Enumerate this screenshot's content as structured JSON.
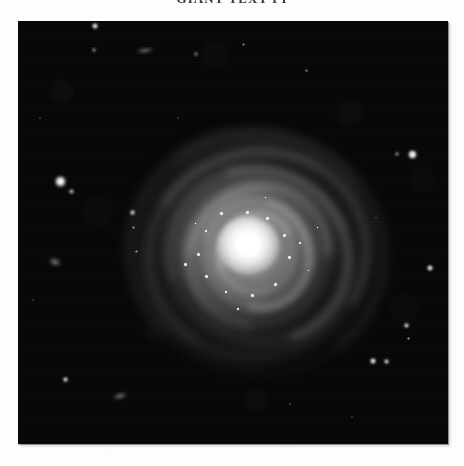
{
  "page": {
    "background_color": "#fdfdfd",
    "width": 464,
    "height": 466
  },
  "caption": {
    "text": "GIANT TEXT PI",
    "clipped": "true",
    "color": "#3a3a3a"
  },
  "plate": {
    "label": "astronomical-image-plate",
    "x": 18,
    "y": 21,
    "width": 430,
    "height": 423,
    "sky_color": "#060606",
    "border_color": "#050505"
  },
  "galaxy": {
    "name": "face-on-spiral-galaxy",
    "center_x": 248,
    "center_y": 245,
    "core_color": "#ffffff",
    "halo_color": "#d7d7d7",
    "arm_count": 4,
    "arms": [
      {
        "w": 210,
        "h": 196,
        "rot": -14,
        "thick": 9,
        "alpha": 0.2,
        "blur": 5,
        "dash_rot": 0
      },
      {
        "w": 172,
        "h": 160,
        "rot": 26,
        "thick": 10,
        "alpha": 0.24,
        "blur": 4.5,
        "dash_rot": 0
      },
      {
        "w": 134,
        "h": 124,
        "rot": -42,
        "thick": 10,
        "alpha": 0.28,
        "blur": 4,
        "dash_rot": 0
      },
      {
        "w": 100,
        "h": 93,
        "rot": 58,
        "thick": 9,
        "alpha": 0.3,
        "blur": 3.4,
        "dash_rot": 0
      },
      {
        "w": 246,
        "h": 230,
        "rot": 8,
        "thick": 8,
        "alpha": 0.13,
        "blur": 6,
        "dash_rot": 0
      },
      {
        "w": 72,
        "h": 66,
        "rot": -70,
        "thick": 8,
        "alpha": 0.3,
        "blur": 3,
        "dash_rot": 0
      }
    ],
    "knots": [
      {
        "x": 248,
        "y": 213,
        "d": 4.0
      },
      {
        "x": 268,
        "y": 219,
        "d": 3.4
      },
      {
        "x": 285,
        "y": 236,
        "d": 3.2
      },
      {
        "x": 290,
        "y": 258,
        "d": 3.8
      },
      {
        "x": 276,
        "y": 285,
        "d": 3.2
      },
      {
        "x": 253,
        "y": 296,
        "d": 3.4
      },
      {
        "x": 226,
        "y": 292,
        "d": 3.0
      },
      {
        "x": 207,
        "y": 277,
        "d": 4.0
      },
      {
        "x": 199,
        "y": 255,
        "d": 3.2
      },
      {
        "x": 206,
        "y": 231,
        "d": 3.0
      },
      {
        "x": 222,
        "y": 214,
        "d": 3.2
      },
      {
        "x": 300,
        "y": 243,
        "d": 3.0
      },
      {
        "x": 186,
        "y": 265,
        "d": 4.2
      },
      {
        "x": 238,
        "y": 309,
        "d": 3.0
      },
      {
        "x": 309,
        "y": 271,
        "d": 2.8
      },
      {
        "x": 266,
        "y": 198,
        "d": 2.6
      },
      {
        "x": 196,
        "y": 224,
        "d": 2.6
      },
      {
        "x": 318,
        "y": 228,
        "d": 2.4
      }
    ]
  },
  "field_stars": [
    {
      "name": "star-bright-west",
      "x": 60,
      "y": 181,
      "d": 11,
      "mag": 1.0
    },
    {
      "name": "star-companion-west",
      "x": 71,
      "y": 191,
      "d": 5,
      "mag": 0.7
    },
    {
      "name": "star-bright-northeast",
      "x": 412,
      "y": 154,
      "d": 9,
      "mag": 0.95
    },
    {
      "name": "star-companion-northeast",
      "x": 397,
      "y": 154,
      "d": 4,
      "mag": 0.6
    },
    {
      "name": "star-top-north",
      "x": 95,
      "y": 26,
      "d": 6,
      "mag": 0.9
    },
    {
      "name": "star-upper-left",
      "x": 94,
      "y": 50,
      "d": 4,
      "mag": 0.6
    },
    {
      "name": "star-upper-mid",
      "x": 196,
      "y": 54,
      "d": 4,
      "mag": 0.55
    },
    {
      "name": "star-upper-right",
      "x": 243,
      "y": 44,
      "d": 3,
      "mag": 0.45
    },
    {
      "name": "star-mid-left-a",
      "x": 132,
      "y": 212,
      "d": 5,
      "mag": 0.85
    },
    {
      "name": "star-mid-left-b",
      "x": 133,
      "y": 227,
      "d": 3,
      "mag": 0.5
    },
    {
      "name": "star-mid-left-c",
      "x": 136,
      "y": 251,
      "d": 3,
      "mag": 0.5
    },
    {
      "name": "star-east-mid",
      "x": 430,
      "y": 268,
      "d": 6,
      "mag": 0.9
    },
    {
      "name": "star-double-left",
      "x": 373,
      "y": 361,
      "d": 6,
      "mag": 0.92
    },
    {
      "name": "star-double-right",
      "x": 386,
      "y": 361,
      "d": 5,
      "mag": 0.85
    },
    {
      "name": "star-right-upper",
      "x": 406,
      "y": 325,
      "d": 5,
      "mag": 0.85
    },
    {
      "name": "star-right-lower",
      "x": 408,
      "y": 338,
      "d": 3,
      "mag": 0.55
    },
    {
      "name": "star-southwest",
      "x": 65,
      "y": 379,
      "d": 5,
      "mag": 0.88
    },
    {
      "name": "star-north-faint",
      "x": 306,
      "y": 70,
      "d": 3,
      "mag": 0.45
    },
    {
      "name": "star-northwest-faint",
      "x": 40,
      "y": 118,
      "d": 2,
      "mag": 0.35
    },
    {
      "name": "star-south-faint",
      "x": 290,
      "y": 404,
      "d": 2,
      "mag": 0.35
    },
    {
      "name": "star-southeast-faint",
      "x": 352,
      "y": 417,
      "d": 2,
      "mag": 0.3
    },
    {
      "name": "star-west-faint",
      "x": 33,
      "y": 300,
      "d": 2,
      "mag": 0.3
    },
    {
      "name": "star-center-north-faint",
      "x": 178,
      "y": 118,
      "d": 2,
      "mag": 0.3
    },
    {
      "name": "star-east-north-faint",
      "x": 376,
      "y": 218,
      "d": 2,
      "mag": 0.28
    }
  ],
  "faint_objects": [
    {
      "name": "smudge-galaxy-upper",
      "x": 145,
      "y": 50,
      "w": 16,
      "h": 5,
      "rot": -6
    },
    {
      "name": "smudge-galaxy-left",
      "x": 55,
      "y": 262,
      "w": 12,
      "h": 8,
      "rot": 20
    },
    {
      "name": "smudge-faint-lower",
      "x": 120,
      "y": 396,
      "w": 14,
      "h": 6,
      "rot": -12
    }
  ]
}
